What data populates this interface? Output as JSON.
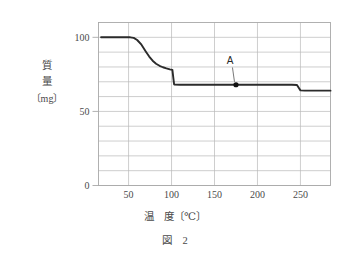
{
  "figure": {
    "caption": "図　2",
    "y_axis_title_lines": [
      "質",
      "量",
      "〔mg〕"
    ],
    "x_axis_title": "温　度〔℃〕"
  },
  "colors": {
    "curve": "#2b2b2b",
    "grid": "#b9b9b9",
    "frame": "#a8a8a8",
    "text": "#4a4a4a",
    "marker": "#111111",
    "leader": "#555555",
    "background": "#ffffff"
  },
  "chart_data": {
    "type": "line",
    "title": "図　2",
    "xlabel": "温　度〔℃〕",
    "ylabel": "質　量〔mg〕",
    "xlim": [
      15,
      285
    ],
    "ylim": [
      0,
      110
    ],
    "grid": true,
    "legend": "none",
    "xticks": [
      50,
      100,
      150,
      200,
      250
    ],
    "xtick_labels": [
      "50",
      "100",
      "150",
      "200",
      "250"
    ],
    "yticks": [
      0,
      50,
      100
    ],
    "ytick_labels": [
      "0",
      "50",
      "100"
    ],
    "y_gridline_step": 10,
    "x_gridline_step": 50,
    "series": [
      {
        "name": "質量",
        "x": [
          18,
          40,
          52,
          56,
          60,
          65,
          70,
          74,
          78,
          82,
          86,
          90,
          94,
          98,
          101,
          102,
          103,
          110,
          130,
          150,
          175,
          200,
          225,
          240,
          246,
          248,
          250,
          255,
          270,
          285
        ],
        "y": [
          100,
          100,
          100,
          99.6,
          98.2,
          95.0,
          90.5,
          87.0,
          84.2,
          82.2,
          80.8,
          79.8,
          79.0,
          78.4,
          78.0,
          73.0,
          68.2,
          68.0,
          68.0,
          68.0,
          68.0,
          68.0,
          68.0,
          68.0,
          67.8,
          66.0,
          64.2,
          64.0,
          64.0,
          64.0
        ]
      }
    ],
    "annotations": [
      {
        "label": "A",
        "point_x": 175,
        "point_y": 68,
        "label_x": 168,
        "label_y": 82,
        "marker": "filled-circle"
      }
    ]
  }
}
